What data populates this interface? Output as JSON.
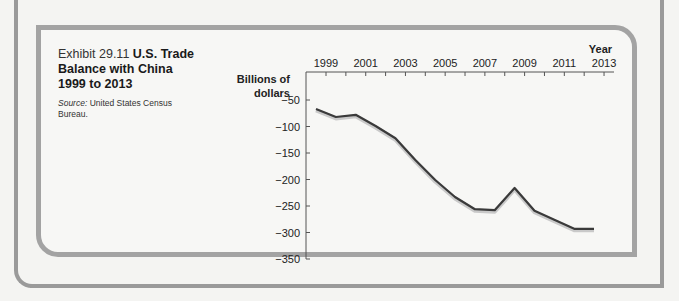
{
  "caption": {
    "exhibit_label": "Exhibit 29.11",
    "title": "U.S. Trade Balance with China 1999 to 2013",
    "source_label": "Source:",
    "source_text": "United States Census Bureau."
  },
  "colors": {
    "frame": "#9a9a9a",
    "line": "#3a3a3a",
    "background": "#f4f4f2"
  },
  "chart_data": {
    "type": "line",
    "title": "U.S. Trade Balance with China 1999 to 2013",
    "xlabel": "Year",
    "ylabel": "Billions of dollars",
    "x": [
      1999,
      2000,
      2001,
      2002,
      2003,
      2004,
      2005,
      2006,
      2007,
      2008,
      2009,
      2010,
      2011,
      2012,
      2013
    ],
    "series": [
      {
        "name": "U.S. Trade Balance with China",
        "values": [
          -67,
          -82,
          -78,
          -99,
          -122,
          -163,
          -201,
          -233,
          -256,
          -258,
          -216,
          -259,
          -276,
          -293,
          -293
        ]
      }
    ],
    "x_tick_labels": [
      "1999",
      "2001",
      "2003",
      "2005",
      "2007",
      "2009",
      "2011",
      "2013"
    ],
    "y_tick_labels": [
      "-50",
      "-100",
      "-150",
      "-200",
      "-250",
      "-300",
      "-350"
    ],
    "y_ticks": [
      -50,
      -100,
      -150,
      -200,
      -250,
      -300,
      -350
    ],
    "ylim": [
      -350,
      -25
    ],
    "xlim": [
      1998.5,
      2013.5
    ],
    "x_axis_position": "top",
    "grid": false,
    "legend": "none"
  }
}
